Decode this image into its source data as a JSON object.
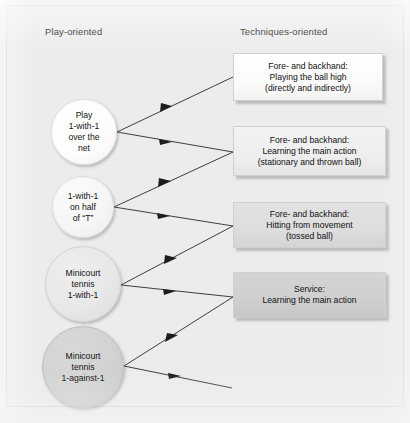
{
  "diagram": {
    "columns": {
      "left_header": "Play-oriented",
      "right_header": "Techniques-oriented"
    },
    "play_oriented_nodes": [
      {
        "id": "play-1-with-1-over-the-net",
        "text": "Play\n1-with-1\nover the\nnet",
        "shape": "circle",
        "fill": "#fdfdfd"
      },
      {
        "id": "1-with-1-on-half-of-t",
        "text": "1-with-1\non half\nof “T”",
        "shape": "circle",
        "fill": "#f6f6f6"
      },
      {
        "id": "minicourt-tennis-1-with-1",
        "text": "Minicourt\ntennis\n1-with-1",
        "shape": "circle",
        "fill": "#e8e8e8"
      },
      {
        "id": "minicourt-tennis-1-against-1",
        "text": "Minicourt\ntennis\n1-against-1",
        "shape": "circle",
        "fill": "#d2d2d2"
      }
    ],
    "techniques_oriented_nodes": [
      {
        "id": "fore-backhand-playing-ball-high",
        "text": "Fore- and backhand:\nPlaying the ball high\n(directly and indirectly)",
        "shape": "box",
        "fill": "#fbfbfb"
      },
      {
        "id": "fore-backhand-learning-main-action",
        "text": "Fore- and backhand:\nLearning the main action\n(stationary and thrown ball)",
        "shape": "box",
        "fill": "#eeeeee"
      },
      {
        "id": "fore-backhand-hitting-from-movement",
        "text": "Fore- and backhand:\nHitting from movement\n(tossed ball)",
        "shape": "box",
        "fill": "#dddddd"
      },
      {
        "id": "service-learning-main-action",
        "text": "Service:\nLearning the main action",
        "shape": "box",
        "fill": "#cfcfcf"
      }
    ],
    "caption": "",
    "colors": {
      "background": "#ededed",
      "frame_border": "#d6d6d6",
      "connector": "#2a2a2a",
      "text": "#121212"
    }
  }
}
